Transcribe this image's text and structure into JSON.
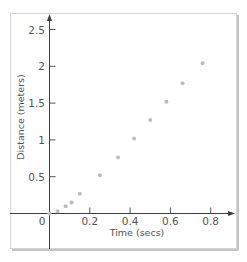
{
  "chart_data": {
    "type": "scatter",
    "title": "",
    "xlabel": "Time (secs)",
    "ylabel": "Distance (meters)",
    "xlim": [
      -0.2,
      0.93
    ],
    "ylim": [
      -0.5,
      2.7
    ],
    "grid": false,
    "legend": null,
    "x_ticks": [
      "0",
      "0.2",
      "0.4",
      "0.6",
      "0.8"
    ],
    "y_ticks": [
      "0.5",
      "1",
      "1.5",
      "2",
      "2.5"
    ],
    "series": [
      {
        "name": "distance",
        "color": "#bdbdbd",
        "x": [
          0.0,
          0.04,
          0.08,
          0.11,
          0.15,
          0.25,
          0.34,
          0.42,
          0.5,
          0.58,
          0.66,
          0.76
        ],
        "y": [
          0.0,
          0.03,
          0.1,
          0.15,
          0.27,
          0.52,
          0.76,
          1.02,
          1.27,
          1.52,
          1.77,
          2.04
        ]
      }
    ]
  },
  "colors": {
    "axis": "#3e3e3e",
    "text": "#555555",
    "points": "#bdbdbd",
    "frame": "#d6d6d6"
  }
}
